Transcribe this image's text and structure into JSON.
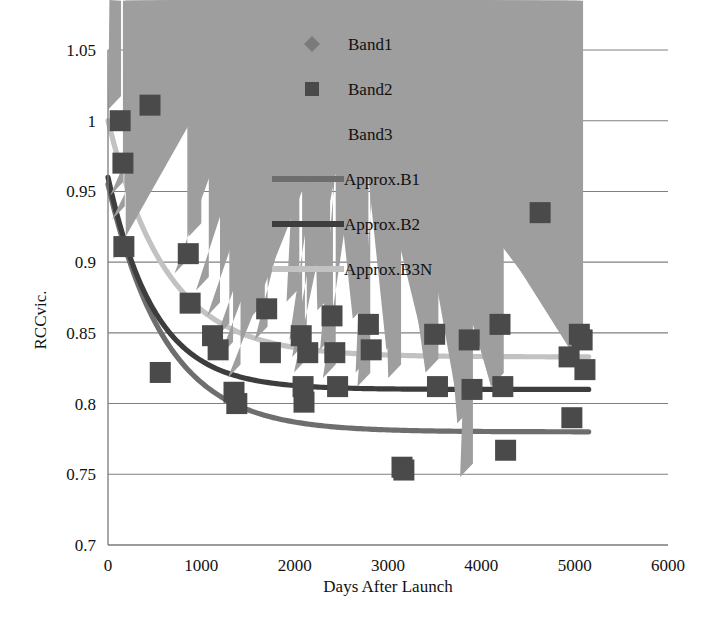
{
  "chart_data": {
    "type": "scatter",
    "title": "",
    "xlabel": "Days After Launch",
    "ylabel": "RCCvic.",
    "xlim": [
      0,
      6000
    ],
    "ylim": [
      0.7,
      1.05
    ],
    "xticks": [
      0,
      1000,
      2000,
      3000,
      4000,
      5000,
      6000
    ],
    "xtick_labels": [
      "0",
      "1000",
      "2000",
      "3000",
      "4000",
      "5000",
      "6000"
    ],
    "yticks": [
      0.7,
      0.75,
      0.8,
      0.85,
      0.9,
      0.95,
      1,
      1.05
    ],
    "ytick_labels": [
      "0.7",
      "0.75",
      "0.8",
      "0.85",
      "0.9",
      "0.95",
      "1",
      "1.05"
    ],
    "grid": "horizontal",
    "legend_position": "top-center-inside",
    "colors": {
      "band1": "#7b7b7b",
      "band2": "#4a4a4a",
      "band3": "#9e9e9e",
      "approx_b1": "#6e6e6e",
      "approx_b2": "#3d3d3d",
      "approx_b3n": "#c2c2c2",
      "gridline": "#808080",
      "axis": "#7a7a7a",
      "text": "#111111"
    },
    "legend": [
      {
        "label": "Band1",
        "marker": "diamond",
        "color": "#7b7b7b"
      },
      {
        "label": "Band2",
        "marker": "square",
        "color": "#4a4a4a"
      },
      {
        "label": "Band3",
        "marker": "triangle",
        "color": "#9e9e9e"
      },
      {
        "label": "Approx.B1",
        "marker": "line",
        "color": "#6e6e6e"
      },
      {
        "label": "Approx.B2",
        "marker": "line",
        "color": "#3d3d3d"
      },
      {
        "label": "Approx.B3N",
        "marker": "line",
        "color": "#c2c2c2"
      }
    ],
    "series": [
      {
        "name": "Band1",
        "marker": "diamond",
        "color": "#7b7b7b",
        "points": [
          [
            120,
            0.855
          ],
          [
            150,
            0.968
          ],
          [
            420,
            1.0
          ],
          [
            490,
            0.998
          ],
          [
            900,
            0.911
          ],
          [
            1020,
            0.869
          ],
          [
            1150,
            0.845
          ],
          [
            1230,
            0.826
          ],
          [
            1330,
            0.802
          ],
          [
            1420,
            0.8
          ],
          [
            1500,
            0.771
          ],
          [
            1760,
            0.803
          ],
          [
            1800,
            0.771
          ],
          [
            2080,
            0.752
          ],
          [
            2100,
            0.795
          ],
          [
            2120,
            0.783
          ],
          [
            2180,
            0.812
          ],
          [
            2420,
            0.79
          ],
          [
            2450,
            0.856
          ],
          [
            2470,
            0.806
          ],
          [
            2500,
            0.782
          ],
          [
            2800,
            0.776
          ],
          [
            2830,
            0.845
          ],
          [
            2850,
            0.806
          ],
          [
            3150,
            0.739
          ],
          [
            3180,
            0.728
          ],
          [
            3200,
            0.758
          ],
          [
            3250,
            0.805
          ],
          [
            3560,
            0.84
          ],
          [
            3580,
            0.806
          ],
          [
            3900,
            0.782
          ],
          [
            3950,
            0.806
          ],
          [
            4250,
            0.8
          ],
          [
            4280,
            0.846
          ],
          [
            4300,
            0.79
          ],
          [
            4620,
            0.721
          ],
          [
            4650,
            0.841
          ],
          [
            4960,
            0.752
          ],
          [
            5050,
            0.761
          ],
          [
            5100,
            0.8
          ],
          [
            5120,
            0.845
          ]
        ]
      },
      {
        "name": "Band2",
        "marker": "square",
        "color": "#4a4a4a",
        "points": [
          [
            130,
            1.0
          ],
          [
            160,
            0.97
          ],
          [
            170,
            0.911
          ],
          [
            450,
            1.011
          ],
          [
            560,
            0.822
          ],
          [
            860,
            0.906
          ],
          [
            880,
            0.871
          ],
          [
            1120,
            0.848
          ],
          [
            1180,
            0.838
          ],
          [
            1350,
            0.808
          ],
          [
            1380,
            0.8
          ],
          [
            1700,
            0.867
          ],
          [
            1740,
            0.836
          ],
          [
            2070,
            0.848
          ],
          [
            2090,
            0.812
          ],
          [
            2100,
            0.801
          ],
          [
            2140,
            0.836
          ],
          [
            2400,
            0.862
          ],
          [
            2430,
            0.836
          ],
          [
            2460,
            0.812
          ],
          [
            2790,
            0.856
          ],
          [
            2820,
            0.838
          ],
          [
            3150,
            0.755
          ],
          [
            3170,
            0.753
          ],
          [
            3500,
            0.849
          ],
          [
            3530,
            0.812
          ],
          [
            3870,
            0.845
          ],
          [
            3900,
            0.81
          ],
          [
            4200,
            0.856
          ],
          [
            4230,
            0.812
          ],
          [
            4260,
            0.767
          ],
          [
            4630,
            0.935
          ],
          [
            4940,
            0.833
          ],
          [
            4970,
            0.79
          ],
          [
            5050,
            0.849
          ],
          [
            5080,
            0.845
          ],
          [
            5110,
            0.824
          ]
        ]
      },
      {
        "name": "Band3",
        "marker": "triangle",
        "color": "#9e9e9e",
        "points": [
          [
            140,
            1.008
          ],
          [
            160,
            0.947
          ],
          [
            180,
            0.93
          ],
          [
            190,
            0.902
          ],
          [
            520,
            0.96
          ],
          [
            850,
            0.892
          ],
          [
            1000,
            0.918
          ],
          [
            1080,
            0.88
          ],
          [
            1200,
            0.862
          ],
          [
            1300,
            0.847
          ],
          [
            1340,
            0.834
          ],
          [
            1420,
            0.818
          ],
          [
            1680,
            0.862
          ],
          [
            1710,
            0.845
          ],
          [
            2050,
            0.872
          ],
          [
            2080,
            0.845
          ],
          [
            2110,
            0.833
          ],
          [
            2130,
            0.822
          ],
          [
            2380,
            0.866
          ],
          [
            2410,
            0.838
          ],
          [
            2440,
            0.818
          ],
          [
            2760,
            0.86
          ],
          [
            2790,
            0.822
          ],
          [
            2810,
            0.812
          ],
          [
            3120,
            0.838
          ],
          [
            3140,
            0.818
          ],
          [
            3480,
            0.879
          ],
          [
            3510,
            0.845
          ],
          [
            3540,
            0.822
          ],
          [
            3850,
            0.812
          ],
          [
            3880,
            0.786
          ],
          [
            3910,
            0.748
          ],
          [
            4180,
            0.866
          ],
          [
            4210,
            0.82
          ],
          [
            4240,
            0.812
          ],
          [
            4610,
            0.92
          ],
          [
            4930,
            0.861
          ],
          [
            5020,
            0.869
          ],
          [
            5060,
            0.846
          ],
          [
            5090,
            0.838
          ]
        ]
      }
    ],
    "fits": [
      {
        "name": "Approx.B1",
        "color": "#6e6e6e",
        "x_start": 0,
        "x_end": 5150,
        "y_start": 0.955,
        "asymptote": 0.78,
        "decay_days": 620
      },
      {
        "name": "Approx.B2",
        "color": "#3d3d3d",
        "x_start": 0,
        "x_end": 5150,
        "y_start": 0.96,
        "asymptote": 0.81,
        "decay_days": 500
      },
      {
        "name": "Approx.B3N",
        "color": "#c2c2c2",
        "x_start": 0,
        "x_end": 5150,
        "y_start": 1.0,
        "asymptote": 0.833,
        "decay_days": 620
      }
    ]
  }
}
